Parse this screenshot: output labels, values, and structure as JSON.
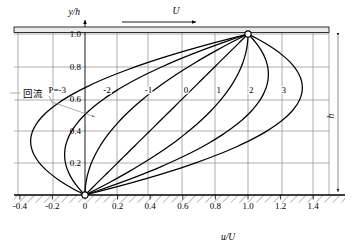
{
  "figure": {
    "kind": "velocity-profile-chart",
    "top_arrow_label": "U",
    "right_dimension_label": "h",
    "annotation_cn": "回流"
  },
  "chart_data": {
    "type": "line",
    "title": "",
    "xlabel": "u/U",
    "ylabel": "y/h",
    "xlim": [
      -0.5,
      1.55
    ],
    "ylim": [
      0,
      1.08
    ],
    "grid": true,
    "legend": "inline-curve-labels",
    "xticks": [
      -0.4,
      -0.2,
      0,
      0.2,
      0.4,
      0.6,
      0.8,
      1.0,
      1.2,
      1.4
    ],
    "xticklabels": [
      "-0.4",
      "-0.2",
      "0",
      "0.2",
      "0.4",
      "0.6",
      "0.8",
      "1.0",
      "1.2",
      "1.4"
    ],
    "yticks": [
      0.2,
      0.4,
      0.6,
      0.8,
      1.0
    ],
    "yticklabels": [
      "0.2",
      "0.4",
      "0.6",
      "0.8",
      "1.0"
    ],
    "equation": "u/U = n + P*n*(1-n), n = y/h",
    "parameter_symbol": "P",
    "first_curve_label": "P=-3",
    "series": [
      {
        "name": "P=-3",
        "P": -3,
        "label": "P=-3",
        "label_x": -0.17,
        "label_y": 0.655,
        "x": [
          0,
          -0.19,
          -0.28,
          -0.27,
          -0.16,
          0.05,
          0.34,
          0.71,
          1.0
        ],
        "y": [
          0,
          0.125,
          0.25,
          0.375,
          0.5,
          0.625,
          0.75,
          0.875,
          1.0
        ]
      },
      {
        "name": "-2",
        "P": -2,
        "label": "-2",
        "label_x": 0.135,
        "label_y": 0.655,
        "x": [
          0,
          -0.094,
          -0.125,
          -0.094,
          0.0,
          0.156,
          0.375,
          0.656,
          1.0
        ],
        "y": [
          0,
          0.125,
          0.25,
          0.375,
          0.5,
          0.625,
          0.75,
          0.875,
          1.0
        ]
      },
      {
        "name": "-1",
        "P": -1,
        "label": "-1",
        "label_x": 0.39,
        "label_y": 0.655,
        "x": [
          0,
          0.016,
          0.063,
          0.141,
          0.25,
          0.391,
          0.563,
          0.766,
          1.0
        ],
        "y": [
          0,
          0.125,
          0.25,
          0.375,
          0.5,
          0.625,
          0.75,
          0.875,
          1.0
        ]
      },
      {
        "name": "0",
        "P": 0,
        "label": "0",
        "label_x": 0.62,
        "label_y": 0.655,
        "x": [
          0,
          0.125,
          0.25,
          0.375,
          0.5,
          0.625,
          0.75,
          0.875,
          1.0
        ],
        "y": [
          0,
          0.125,
          0.25,
          0.375,
          0.5,
          0.625,
          0.75,
          0.875,
          1.0
        ]
      },
      {
        "name": "1",
        "P": 1,
        "label": "1",
        "label_x": 0.82,
        "label_y": 0.655,
        "x": [
          0,
          0.234,
          0.438,
          0.609,
          0.75,
          0.859,
          0.938,
          0.984,
          1.0
        ],
        "y": [
          0,
          0.125,
          0.25,
          0.375,
          0.5,
          0.625,
          0.75,
          0.875,
          1.0
        ]
      },
      {
        "name": "2",
        "P": 2,
        "label": "2",
        "label_x": 1.02,
        "label_y": 0.655,
        "x": [
          0,
          0.344,
          0.625,
          0.844,
          1.0,
          1.094,
          1.125,
          1.094,
          1.0
        ],
        "y": [
          0,
          0.125,
          0.25,
          0.375,
          0.5,
          0.625,
          0.75,
          0.875,
          1.0
        ]
      },
      {
        "name": "3",
        "P": 3,
        "label": "3",
        "label_x": 1.22,
        "label_y": 0.655,
        "x": [
          0,
          0.453,
          0.813,
          1.078,
          1.25,
          1.328,
          1.313,
          1.203,
          1.0
        ],
        "y": [
          0,
          0.125,
          0.25,
          0.375,
          0.5,
          0.625,
          0.75,
          0.875,
          1.0
        ]
      }
    ],
    "annotations": [
      {
        "text": "回流",
        "x": -0.42,
        "y": 0.72,
        "note": "backflow region pointer"
      }
    ],
    "markers": [
      {
        "x": 0,
        "y": 0,
        "style": "open-circle"
      },
      {
        "x": 1.0,
        "y": 1.0,
        "style": "open-circle"
      }
    ]
  }
}
